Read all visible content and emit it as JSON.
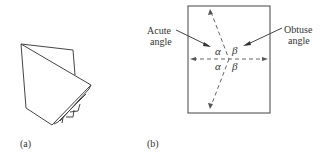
{
  "figure_a": {
    "caption": "(a)",
    "description": "folded-paper-sheets"
  },
  "figure_b": {
    "caption": "(b)",
    "labels": {
      "acute_line1": "Acute",
      "acute_line2": "angle",
      "obtuse_line1": "Obtuse",
      "obtuse_line2": "angle"
    },
    "angles": {
      "alpha_top": "α",
      "beta_top": "β",
      "alpha_bottom": "α",
      "beta_bottom": "β"
    }
  },
  "colors": {
    "stroke": "#444444",
    "dashed": "#666666"
  }
}
